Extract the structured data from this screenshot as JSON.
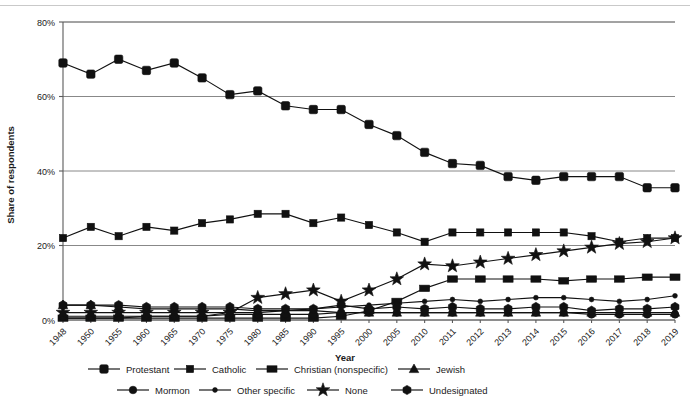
{
  "chart_data": {
    "type": "line",
    "title": "",
    "xlabel": "Year",
    "ylabel": "Share of respondents",
    "ylim": [
      0,
      80
    ],
    "ytick_labels": [
      "0%",
      "20%",
      "40%",
      "60%",
      "80%"
    ],
    "ytick_values": [
      0,
      20,
      40,
      60,
      80
    ],
    "grid": true,
    "legend_position": "bottom",
    "categories": [
      "1948",
      "1950",
      "1955",
      "1960",
      "1965",
      "1970",
      "1975",
      "1980",
      "1985",
      "1990",
      "1995",
      "2000",
      "2005",
      "2010",
      "2011",
      "2012",
      "2013",
      "2014",
      "2015",
      "2016",
      "2017",
      "2018",
      "2019"
    ],
    "series": [
      {
        "name": "Protestant",
        "marker": "square-rounded",
        "values": [
          69,
          66,
          70,
          67,
          69,
          65,
          60.5,
          61.5,
          57.5,
          56.5,
          56.5,
          52.5,
          49.5,
          45,
          42,
          41.5,
          38.5,
          37.5,
          38.5,
          38.5,
          38.5,
          35.5,
          35.5
        ]
      },
      {
        "name": "Catholic",
        "marker": "square",
        "values": [
          22,
          25,
          22.5,
          25,
          24,
          26,
          27,
          28.5,
          28.5,
          26,
          27.5,
          25.5,
          23.5,
          21,
          23.5,
          23.5,
          23.5,
          23.5,
          23.5,
          22.5,
          21,
          22,
          22
        ]
      },
      {
        "name": "Christian (nonspecific)",
        "marker": "square-wide",
        "values": [
          0.5,
          0.5,
          0.5,
          0.5,
          0.5,
          0.5,
          0.5,
          0.5,
          0.5,
          0.5,
          1,
          2.5,
          5,
          8.5,
          11,
          11,
          11,
          11,
          10.5,
          11,
          11,
          11.5,
          11.5
        ]
      },
      {
        "name": "Jewish",
        "marker": "triangle",
        "values": [
          4,
          4,
          3.5,
          3,
          3,
          3,
          3,
          2.5,
          2.5,
          2.5,
          2,
          2,
          2,
          2,
          2,
          2,
          2,
          2,
          2,
          2,
          2,
          2,
          2
        ]
      },
      {
        "name": "Mormon",
        "marker": "circle-large",
        "values": [
          1,
          1,
          1,
          1,
          1,
          1,
          1.5,
          1.5,
          1.5,
          1.5,
          2,
          2,
          2,
          2,
          2,
          2,
          2,
          2,
          2,
          1.5,
          1.5,
          1.5,
          1.5
        ]
      },
      {
        "name": "Other specific",
        "marker": "circle-small",
        "values": [
          0.5,
          0.5,
          0.5,
          1,
          1,
          1,
          2,
          2,
          2.5,
          3,
          3.5,
          4,
          4.5,
          5,
          5.5,
          5,
          5.5,
          6,
          6,
          5.5,
          5,
          5.5,
          6.5
        ]
      },
      {
        "name": "None",
        "marker": "star",
        "values": [
          2,
          2,
          2,
          2,
          2,
          2,
          2,
          6,
          7,
          8,
          5,
          8,
          11,
          15,
          14.5,
          15.5,
          16.5,
          17.5,
          18.5,
          19.5,
          20.5,
          21,
          22
        ]
      },
      {
        "name": "Undesignated",
        "marker": "hexagon",
        "values": [
          4,
          4,
          4,
          3.5,
          3.5,
          3.5,
          3.5,
          3,
          3,
          3,
          4,
          3,
          3.5,
          3,
          3.5,
          3,
          3,
          3.5,
          3.5,
          2.5,
          3,
          3,
          3.5
        ]
      }
    ]
  },
  "legend": {
    "items": [
      {
        "label": "Protestant",
        "marker": "square-rounded"
      },
      {
        "label": "Catholic",
        "marker": "square"
      },
      {
        "label": "Christian (nonspecific)",
        "marker": "square-wide"
      },
      {
        "label": "Jewish",
        "marker": "triangle"
      },
      {
        "label": "Mormon",
        "marker": "circle-large"
      },
      {
        "label": "Other specific",
        "marker": "circle-small"
      },
      {
        "label": "None",
        "marker": "star"
      },
      {
        "label": "Undesignated",
        "marker": "hexagon"
      }
    ]
  },
  "colors": {
    "series": "#111111",
    "grid": "#7a7a7a",
    "axis": "#5a5a5a",
    "background": "#ffffff",
    "text": "#1a1a1a"
  }
}
